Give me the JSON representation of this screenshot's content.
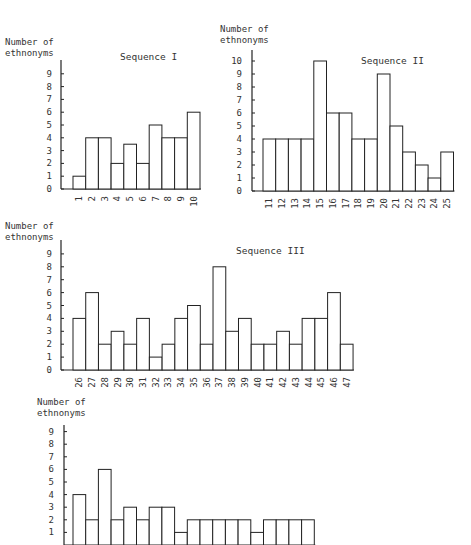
{
  "chart_data": [
    {
      "type": "bar",
      "title": "Sequence I",
      "ylabel": "Number of ethnonyms",
      "xlabel": "",
      "categories": [
        "1",
        "2",
        "3",
        "4",
        "5",
        "6",
        "7",
        "8",
        "9",
        "10"
      ],
      "values": [
        1,
        4,
        4,
        2,
        3.5,
        2,
        5,
        4,
        4,
        6
      ],
      "yticks": [
        0,
        1,
        2,
        3,
        4,
        5,
        6,
        7,
        8,
        9
      ],
      "ylim": [
        0,
        10
      ],
      "grid": false
    },
    {
      "type": "bar",
      "title": "Sequence II",
      "ylabel": "Number of ethnonyms",
      "xlabel": "",
      "categories": [
        "11",
        "12",
        "13",
        "14",
        "15",
        "16",
        "17",
        "18",
        "19",
        "20",
        "21",
        "22",
        "23",
        "24",
        "25"
      ],
      "values": [
        4,
        4,
        4,
        4,
        10,
        6,
        6,
        4,
        4,
        9,
        5,
        3,
        2,
        1,
        3
      ],
      "yticks": [
        0,
        1,
        2,
        3,
        4,
        5,
        6,
        7,
        8,
        9,
        10
      ],
      "ylim": [
        0,
        10.5
      ],
      "grid": false
    },
    {
      "type": "bar",
      "title": "Sequence III",
      "ylabel": "Number of ethnonyms",
      "xlabel": "",
      "categories": [
        "26",
        "27",
        "28",
        "29",
        "30",
        "31",
        "32",
        "33",
        "34",
        "35",
        "36",
        "37",
        "38",
        "39",
        "40",
        "41",
        "42",
        "43",
        "44",
        "45",
        "46",
        "47"
      ],
      "values": [
        4,
        6,
        2,
        3,
        2,
        4,
        1,
        2,
        4,
        5,
        2,
        8,
        3,
        4,
        2,
        2,
        3,
        2,
        4,
        4,
        6,
        2
      ],
      "yticks": [
        0,
        1,
        2,
        3,
        4,
        5,
        6,
        7,
        8,
        9
      ],
      "ylim": [
        0,
        10
      ],
      "grid": false
    },
    {
      "type": "bar",
      "title": "",
      "ylabel": "Number of ethnonyms",
      "xlabel": "",
      "categories": [],
      "values": [
        4,
        2,
        6,
        2,
        3,
        2,
        3,
        3,
        1,
        2,
        2,
        2,
        2,
        2,
        1,
        2,
        2,
        2,
        2
      ],
      "yticks": [
        1,
        2,
        3,
        4,
        5,
        6,
        7,
        8,
        9
      ],
      "ylim": [
        0,
        10
      ],
      "grid": false
    }
  ],
  "ylabel_lines": [
    "Number of",
    "ethnonyms"
  ]
}
